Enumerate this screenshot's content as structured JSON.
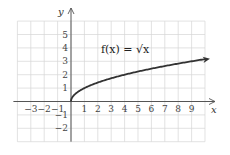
{
  "chart_data": {
    "type": "line",
    "title": "",
    "annotation": "f(x) = √x",
    "function": "sqrt(x)",
    "xlabel": "x",
    "ylabel": "y",
    "xlim": [
      -4,
      10
    ],
    "ylim": [
      -3,
      6
    ],
    "grid": true,
    "x_ticks": [
      -3,
      -2,
      -1,
      1,
      2,
      3,
      4,
      5,
      6,
      7,
      8,
      9
    ],
    "y_ticks": [
      5,
      4,
      3,
      2,
      1,
      -1,
      -2
    ],
    "x_tick_labels": [
      "−3",
      "−2",
      "−1",
      "1",
      "2",
      "3",
      "4",
      "5",
      "6",
      "7",
      "8",
      "9"
    ],
    "y_tick_labels": [
      "5",
      "4",
      "3",
      "2",
      "1",
      "−1",
      "−2"
    ],
    "series": [
      {
        "name": "f(x) = √x",
        "x": [
          0,
          0.25,
          0.5,
          1,
          2,
          3,
          4,
          5,
          6,
          7,
          8,
          9,
          10
        ],
        "values": [
          0,
          0.5,
          0.71,
          1,
          1.41,
          1.73,
          2,
          2.24,
          2.45,
          2.65,
          2.83,
          3,
          3.16
        ],
        "end_arrow": true
      }
    ],
    "colors": {
      "curve": "#333333",
      "grid": "#d6d6d6",
      "axis": "#555555"
    }
  },
  "labels": {
    "formula": "f(x) = √x",
    "x_axis": "x",
    "y_axis": "y"
  }
}
